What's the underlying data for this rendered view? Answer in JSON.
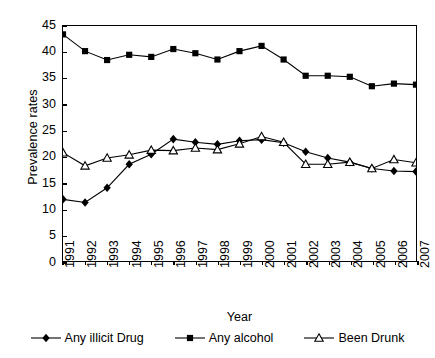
{
  "chart_data": {
    "type": "line",
    "title": "",
    "xlabel": "Year",
    "ylabel": "Prevalence rates",
    "categories": [
      "1991",
      "1992",
      "1993",
      "1994",
      "1995",
      "1996",
      "1997",
      "1998",
      "1999",
      "2000",
      "2001",
      "2002",
      "2003",
      "2004",
      "2005",
      "2006",
      "2007"
    ],
    "xlim": [
      1991,
      2007
    ],
    "ylim": [
      0,
      45
    ],
    "yticks": [
      0,
      5,
      10,
      15,
      20,
      25,
      30,
      35,
      40,
      45
    ],
    "grid": false,
    "legend_position": "bottom",
    "series": [
      {
        "name": "Any illicit Drug",
        "marker": "filled-diamond",
        "color": "#000000",
        "values": [
          11.9,
          11.3,
          14.1,
          18.6,
          20.5,
          23.4,
          22.8,
          22.4,
          23.1,
          23.3,
          22.7,
          21.0,
          19.8,
          19.0,
          17.8,
          17.3,
          17.2
        ]
      },
      {
        "name": "Any alcohol",
        "marker": "filled-square",
        "color": "#000000",
        "values": [
          43.4,
          40.2,
          38.5,
          39.5,
          39.1,
          40.6,
          39.8,
          38.6,
          40.2,
          41.2,
          38.6,
          35.5,
          35.5,
          35.3,
          33.5,
          34.0,
          33.8
        ]
      },
      {
        "name": "Been Drunk",
        "marker": "open-triangle",
        "color": "#000000",
        "values": [
          20.8,
          18.3,
          19.8,
          20.4,
          21.3,
          21.2,
          21.7,
          21.4,
          22.5,
          23.9,
          22.8,
          18.6,
          18.6,
          19.0,
          17.8,
          19.5,
          18.9
        ]
      }
    ]
  }
}
